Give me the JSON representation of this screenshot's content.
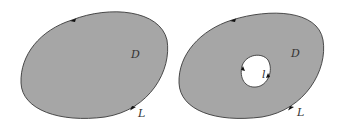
{
  "figure": {
    "colors": {
      "region_fill": "#a6a6a6",
      "boundary": "#3a3a3a",
      "hole_fill": "#ffffff",
      "background": "#ffffff"
    },
    "left_diagram": {
      "region_label": "D",
      "boundary_label": "L",
      "description": "simply connected region D bounded by closed curve L with counterclockwise orientation arrows"
    },
    "right_diagram": {
      "region_label": "D",
      "boundary_label": "L",
      "hole_label": "l",
      "description": "multiply connected region D with outer boundary L (counterclockwise) and inner boundary l (clockwise)"
    }
  }
}
